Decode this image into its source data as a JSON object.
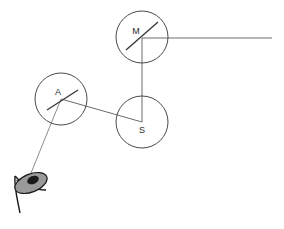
{
  "figure": {
    "background_color": "#ffffff",
    "width": 284,
    "height": 229,
    "stroke_color": "#6b6b6b",
    "component_stroke_color": "#4a4a4a",
    "label_color": "#2b2b2b",
    "eye_fill_color": "#9a9a9a",
    "eye_pupil_color": "#1a1a1a"
  },
  "nodes": [
    {
      "id": "mirror",
      "label": "M",
      "name": "mirror",
      "cx": 142,
      "cy": 37,
      "r": 26,
      "label_x": 136,
      "label_y": 32,
      "has_internal_line": true,
      "internal_line": {
        "x1": 126,
        "y1": 50,
        "x2": 158,
        "y2": 22
      }
    },
    {
      "id": "analyzer",
      "label": "A",
      "name": "analyzer",
      "cx": 61,
      "cy": 99,
      "r": 26,
      "label_x": 58,
      "label_y": 93,
      "has_internal_line": true,
      "internal_line": {
        "x1": 47,
        "y1": 110,
        "x2": 78,
        "y2": 90
      }
    },
    {
      "id": "screen",
      "label": "S",
      "name": "screen",
      "cx": 142,
      "cy": 122,
      "r": 26,
      "label_x": 142,
      "label_y": 131,
      "has_internal_line": false,
      "internal_line": null
    }
  ],
  "beams": [
    {
      "id": "beam-mirror-to-right",
      "name": "beam-mirror-to-right-edge",
      "x1": 142,
      "y1": 38,
      "x2": 272,
      "y2": 38
    },
    {
      "id": "beam-mirror-to-screen",
      "name": "beam-mirror-to-screen",
      "x1": 142,
      "y1": 38,
      "x2": 142,
      "y2": 122
    },
    {
      "id": "beam-analyzer-to-screen",
      "name": "beam-analyzer-to-screen",
      "x1": 61,
      "y1": 99,
      "x2": 142,
      "y2": 122
    },
    {
      "id": "beam-analyzer-to-eye",
      "name": "beam-analyzer-to-observer",
      "x1": 61,
      "y1": 99,
      "x2": 29,
      "y2": 178
    }
  ],
  "observer": {
    "name": "eye-observer",
    "ellipse": {
      "cx": 31,
      "cy": 183,
      "rx": 17,
      "ry": 9,
      "rotation": -22
    },
    "pupil": {
      "cx": 33,
      "cy": 180,
      "rx": 6,
      "ry": 4,
      "rotation": -22
    },
    "stem_path": "M 15 176 C 14 188 18 202 20 213",
    "cone_path": "M 15 176 C 24 186 36 190 46 190",
    "inner_path": "M 16 180 C 26 185 35 188 45 190"
  }
}
